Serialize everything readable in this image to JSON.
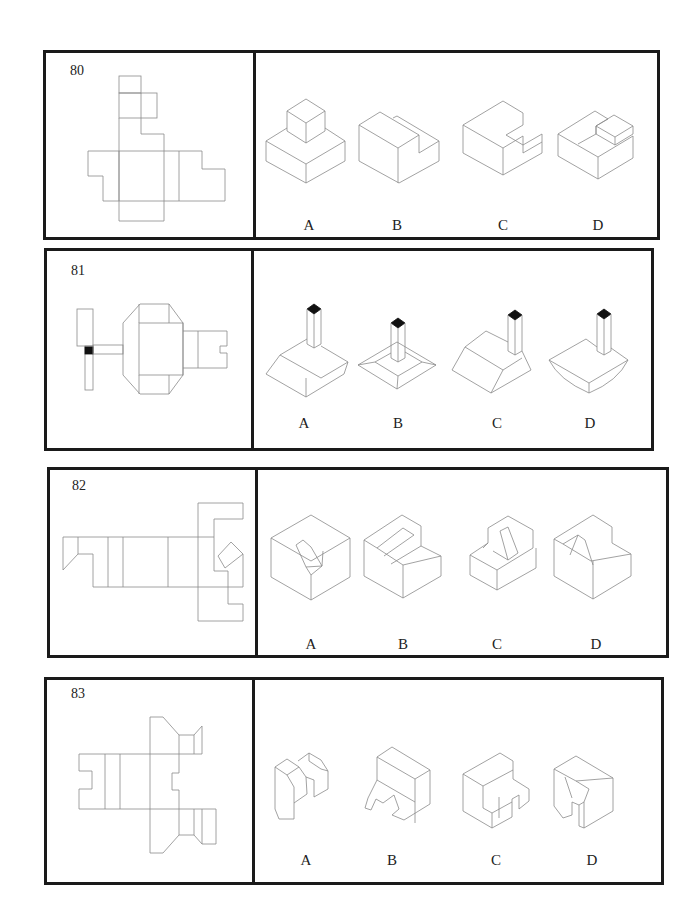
{
  "problems": [
    {
      "number": "80",
      "options": [
        {
          "label": "A",
          "description": "small cube on top of larger square block"
        },
        {
          "label": "B",
          "description": "block with step down at right"
        },
        {
          "label": "C",
          "description": "block with L-shaped notch cut at back-right"
        },
        {
          "label": "D",
          "description": "block with small raised cube at back"
        }
      ]
    },
    {
      "number": "81",
      "options": [
        {
          "label": "A",
          "description": "frustum base with pillar, black top"
        },
        {
          "label": "B",
          "description": "flat square plate with frustum and center pillar"
        },
        {
          "label": "C",
          "description": "frustum base with pillar at corner"
        },
        {
          "label": "D",
          "description": "inverted frustum with pillar"
        }
      ]
    },
    {
      "number": "82",
      "options": [
        {
          "label": "A",
          "description": "cube with sloped V-groove"
        },
        {
          "label": "B",
          "description": "stepped block with diagonal slot"
        },
        {
          "label": "C",
          "description": "stepped block with slanted recess on upper"
        },
        {
          "label": "D",
          "description": "stepped block with narrow slanted recess"
        }
      ]
    },
    {
      "number": "83",
      "options": [
        {
          "label": "A",
          "description": "two chamfered blocks joined by a slot"
        },
        {
          "label": "B",
          "description": "block with angled front and U notch"
        },
        {
          "label": "C",
          "description": "stepped block with U notch"
        },
        {
          "label": "D",
          "description": "chamfered block with vertical slot"
        }
      ]
    }
  ]
}
